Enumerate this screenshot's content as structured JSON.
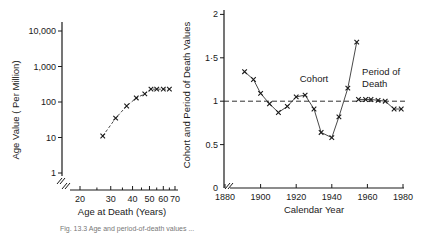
{
  "chart_data": [
    {
      "type": "line",
      "title": "",
      "xlabel": "Age at Death (Years)",
      "ylabel": "Age Value ( Per Million)",
      "xscale": "log",
      "yscale": "log",
      "xlim": [
        18,
        70
      ],
      "ylim": [
        1,
        10000
      ],
      "x_ticks": [
        "20",
        "30",
        "40",
        "50",
        "60",
        "70"
      ],
      "y_ticks": [
        "1",
        "10",
        "100",
        "1,000",
        "10,000"
      ],
      "grid": false,
      "marker": "x",
      "linestyle": "dashed",
      "series": [
        {
          "name": "Age value",
          "x": [
            27,
            32,
            37,
            42,
            47,
            51,
            55,
            60,
            65
          ],
          "values": [
            11,
            35,
            77,
            130,
            170,
            230,
            230,
            230,
            230
          ]
        }
      ]
    },
    {
      "type": "line",
      "title": "",
      "xlabel": "Calendar Year",
      "ylabel": "Cohort and Period of Death Values",
      "xlim": [
        1880,
        1980
      ],
      "ylim": [
        0,
        2
      ],
      "x_ticks": [
        "1880",
        "1900",
        "1920",
        "1940",
        "1960",
        "1980"
      ],
      "y_ticks": [
        "0",
        "0.5",
        "1",
        "1·5",
        "2"
      ],
      "grid": false,
      "reference_line": {
        "y": 1,
        "style": "dashed"
      },
      "annotations": [
        {
          "text": "Cohort",
          "x": 1922,
          "y": 1.22
        },
        {
          "text": "Period of",
          "x": 1957,
          "y": 1.3
        },
        {
          "text": "Death",
          "x": 1957,
          "y": 1.16
        }
      ],
      "series": [
        {
          "name": "Cohort",
          "x": [
            1891,
            1896,
            1900,
            1905,
            1910,
            1915,
            1920,
            1925,
            1930,
            1934,
            1940,
            1944,
            1949,
            1954
          ],
          "values": [
            1.34,
            1.25,
            1.09,
            0.97,
            0.87,
            0.94,
            1.05,
            1.07,
            0.91,
            0.64,
            0.58,
            0.82,
            1.15,
            1.68
          ]
        },
        {
          "name": "Period of Death",
          "x": [
            1955,
            1959,
            1962,
            1966,
            1970,
            1975,
            1979
          ],
          "values": [
            1.02,
            1.02,
            1.02,
            1.01,
            1.0,
            0.91,
            0.91
          ]
        }
      ]
    }
  ],
  "caption": "Fig. 13.3 Age and period-of-death values ..."
}
